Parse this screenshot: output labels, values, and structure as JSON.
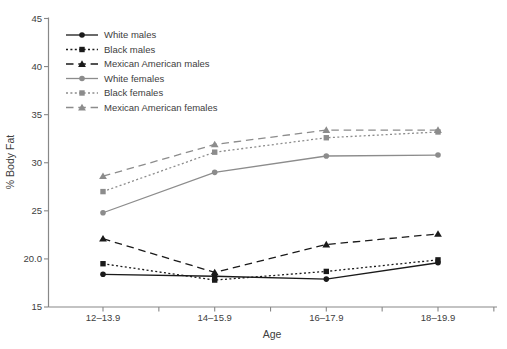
{
  "chart_data": {
    "type": "line",
    "title": "",
    "xlabel": "Age",
    "ylabel": "% Body Fat",
    "categories": [
      "12–13.9",
      "14–15.9",
      "16–17.9",
      "18–19.9"
    ],
    "y_tick_labels": [
      "45",
      "40",
      "35",
      "30",
      "25",
      "20.0",
      "15"
    ],
    "y_tick_values": [
      45,
      40,
      35,
      30,
      25,
      20,
      15
    ],
    "ylim": [
      15,
      45
    ],
    "grid": false,
    "legend_position": "top-left-inside",
    "colors": {
      "males": "#1a1a1a",
      "females": "#8c8c8c",
      "axis": "#888888",
      "text": "#404040"
    },
    "series": [
      {
        "name": "White males",
        "group": "males",
        "color": "#1a1a1a",
        "line_style": "solid",
        "marker": "circle",
        "values": [
          18.4,
          18.2,
          17.9,
          19.6
        ]
      },
      {
        "name": "Black males",
        "group": "males",
        "color": "#1a1a1a",
        "line_style": "dotted",
        "marker": "square",
        "values": [
          19.5,
          17.8,
          18.7,
          19.9
        ]
      },
      {
        "name": "Mexican American males",
        "group": "males",
        "color": "#1a1a1a",
        "line_style": "dashed",
        "marker": "triangle",
        "values": [
          22.1,
          18.6,
          21.5,
          22.6
        ]
      },
      {
        "name": "White females",
        "group": "females",
        "color": "#8c8c8c",
        "line_style": "solid",
        "marker": "circle",
        "values": [
          24.8,
          29.0,
          30.7,
          30.8
        ]
      },
      {
        "name": "Black females",
        "group": "females",
        "color": "#8c8c8c",
        "line_style": "dotted",
        "marker": "square",
        "values": [
          27.0,
          31.1,
          32.6,
          33.2
        ]
      },
      {
        "name": "Mexican American females",
        "group": "females",
        "color": "#8c8c8c",
        "line_style": "dashed",
        "marker": "triangle",
        "values": [
          28.6,
          31.9,
          33.4,
          33.4
        ]
      }
    ]
  }
}
